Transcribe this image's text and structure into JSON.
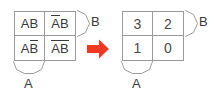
{
  "figure": {
    "background_color": "#ffffff",
    "line_color": "#9a9a9a",
    "text_color": "#3a3a3a",
    "arrow_color": "#ee3a22"
  },
  "left_map": {
    "name": "boolean-term-kmap",
    "axis_labels": {
      "rows": "A",
      "cols": "B"
    },
    "cells": [
      [
        {
          "id": "cell-0-0",
          "segments": [
            {
              "text": "A",
              "bar": false
            },
            {
              "text": "B",
              "bar": false
            }
          ],
          "plain": "AB"
        },
        {
          "id": "cell-0-1",
          "segments": [
            {
              "text": "A",
              "bar": true
            },
            {
              "text": "B",
              "bar": false
            }
          ],
          "plain": "A̅B"
        }
      ],
      [
        {
          "id": "cell-1-0",
          "segments": [
            {
              "text": "A",
              "bar": false
            },
            {
              "text": "B",
              "bar": true
            }
          ],
          "plain": "AB̅"
        },
        {
          "id": "cell-1-1",
          "segments": [
            {
              "text": "AB",
              "bar": true
            }
          ],
          "plain": "A̅B̅"
        }
      ]
    ]
  },
  "right_map": {
    "name": "index-number-kmap",
    "axis_labels": {
      "rows": "A",
      "cols": "B"
    },
    "cells": [
      [
        {
          "id": "cell-0-0",
          "value": "3"
        },
        {
          "id": "cell-0-1",
          "value": "2"
        }
      ],
      [
        {
          "id": "cell-1-0",
          "value": "1"
        },
        {
          "id": "cell-1-1",
          "value": "0"
        }
      ]
    ]
  },
  "arrow": {
    "name": "transform-arrow",
    "direction": "right",
    "color": "#ee3a22"
  }
}
